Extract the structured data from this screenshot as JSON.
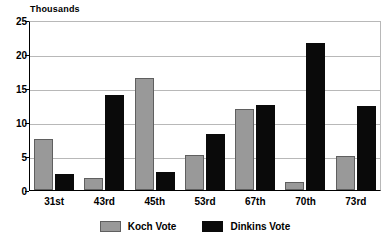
{
  "chart_data": {
    "type": "bar",
    "title": "",
    "subtitle": "",
    "xlabel": "",
    "ylabel": "Thousands",
    "ylim": [
      0,
      25
    ],
    "yticks": [
      0,
      5,
      10,
      15,
      20,
      25
    ],
    "grid": true,
    "legend_position": "bottom",
    "categories": [
      "31st",
      "43rd",
      "45th",
      "53rd",
      "67th",
      "70th",
      "73rd"
    ],
    "series": [
      {
        "name": "Koch Vote",
        "color": "#999999",
        "values": [
          7.5,
          1.7,
          16.5,
          5.1,
          11.9,
          1.2,
          5.0
        ]
      },
      {
        "name": "Dinkins Vote",
        "color": "#0a0a0a",
        "values": [
          2.4,
          13.9,
          2.6,
          8.2,
          12.5,
          21.6,
          12.3
        ]
      }
    ]
  }
}
